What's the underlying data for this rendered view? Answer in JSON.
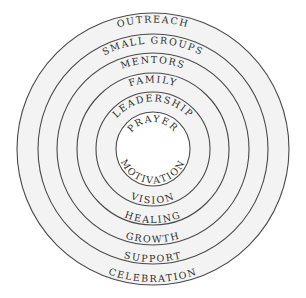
{
  "diagram": {
    "type": "concentric-circles",
    "center": {
      "x": 153,
      "y": 149
    },
    "colors": {
      "background": "#ffffff",
      "band_fill": "#f3f3f3",
      "core_fill": "#ffffff",
      "stroke": "#4a4a4a",
      "text": "#2e2e2e"
    },
    "rings": [
      {
        "radius": 136,
        "top_label": "OUTREACH",
        "bottom_label": "CELEBRATION"
      },
      {
        "radius": 115,
        "top_label": "SMALL GROUPS",
        "bottom_label": "SUPPORT"
      },
      {
        "radius": 96,
        "top_label": "MENTORS",
        "bottom_label": "GROWTH"
      },
      {
        "radius": 76,
        "top_label": "FAMILY",
        "bottom_label": "HEALING"
      },
      {
        "radius": 57,
        "top_label": "LEADERSHIP",
        "bottom_label": "VISION"
      },
      {
        "radius": 37,
        "top_label": "PRAYER",
        "bottom_label": "MOTIVATION"
      }
    ]
  }
}
